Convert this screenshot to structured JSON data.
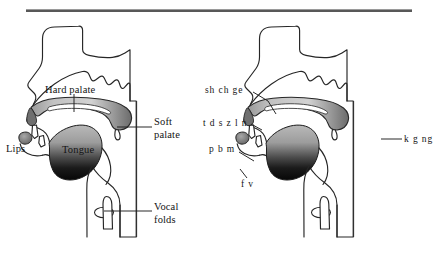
{
  "figure": {
    "top_rule": true,
    "panels": [
      {
        "id": "left-panel",
        "name": "anatomy-diagram",
        "labels": [
          {
            "key": "hard_palate",
            "text": "Hard palate"
          },
          {
            "key": "soft_palate_line1",
            "text": "Soft"
          },
          {
            "key": "soft_palate_line2",
            "text": "palate"
          },
          {
            "key": "lips",
            "text": "Lips"
          },
          {
            "key": "tongue",
            "text": "Tongue"
          },
          {
            "key": "vocal_line1",
            "text": "Vocal"
          },
          {
            "key": "vocal_line2",
            "text": "folds"
          }
        ]
      },
      {
        "id": "right-panel",
        "name": "articulation-diagram",
        "labels": [
          {
            "key": "postalveolar",
            "text": "sh ch ge"
          },
          {
            "key": "alveolar",
            "text": "t d s z l n"
          },
          {
            "key": "bilabial",
            "text": "p b m"
          },
          {
            "key": "labiodental",
            "text": "f v"
          },
          {
            "key": "velar",
            "text": "k g ng"
          }
        ]
      }
    ]
  },
  "colors": {
    "stroke": "#262626",
    "rule": "#585858",
    "palate_fill_light": "#d6d6d6",
    "palate_fill_dark": "#6e6e6e",
    "tongue_light": "#b5b5b5",
    "tongue_dark": "#0d0d0d",
    "background": "#ffffff"
  },
  "caption_fragment": {
    "text": "",
    "visible": false
  }
}
